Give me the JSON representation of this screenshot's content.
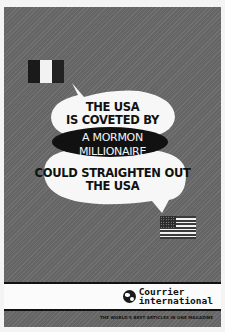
{
  "poster": {
    "background_color": "#6a6a6a",
    "top_flag": "italy-flag",
    "bottom_flag": "usa-flag",
    "bubble_top": {
      "line1": "THE USA",
      "line2": "IS COVETED BY"
    },
    "highlight": {
      "line1": "A MORMON",
      "line2": "MILLIONAIRE"
    },
    "bubble_bottom": {
      "line1": "COULD STRAIGHTEN OUT",
      "line2": "THE USA"
    },
    "brand": {
      "name_line1": "Courrier",
      "name_line2": "international",
      "tagline": "THE WORLD'S BEST ARTICLES IN ONE MAGAZINE"
    }
  }
}
